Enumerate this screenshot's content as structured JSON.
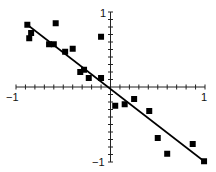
{
  "chart_data": {
    "type": "scatter",
    "title": "",
    "xlabel": "",
    "ylabel": "",
    "xlim": [
      -1,
      1
    ],
    "ylim": [
      -1,
      1
    ],
    "grid": false,
    "legend": null,
    "axes_through_origin": true,
    "minor_ticks_per_side": 10,
    "tick_labels": {
      "x_min": "−1",
      "x_max": "1",
      "y_max": "1",
      "y_min": "−1"
    },
    "marker": "square",
    "marker_color": "#000000",
    "series": [
      {
        "name": "points",
        "points": [
          [
            -0.88,
            0.83
          ],
          [
            -0.84,
            0.72
          ],
          [
            -0.86,
            0.65
          ],
          [
            -0.58,
            0.85
          ],
          [
            -0.65,
            0.57
          ],
          [
            -0.6,
            0.57
          ],
          [
            -0.48,
            0.47
          ],
          [
            -0.4,
            0.51
          ],
          [
            -0.32,
            0.2
          ],
          [
            -0.28,
            0.23
          ],
          [
            -0.23,
            0.12
          ],
          [
            -0.1,
            0.12
          ],
          [
            -0.1,
            0.67
          ],
          [
            0.05,
            -0.25
          ],
          [
            0.15,
            -0.23
          ],
          [
            0.25,
            -0.16
          ],
          [
            0.41,
            -0.32
          ],
          [
            0.5,
            -0.68
          ],
          [
            0.6,
            -0.89
          ],
          [
            0.87,
            -0.76
          ],
          [
            0.99,
            -0.99
          ]
        ]
      }
    ],
    "fit_line": {
      "name": "regression line",
      "from": [
        -0.88,
        0.83
      ],
      "to": [
        0.99,
        -0.99
      ],
      "color": "#000000"
    }
  }
}
